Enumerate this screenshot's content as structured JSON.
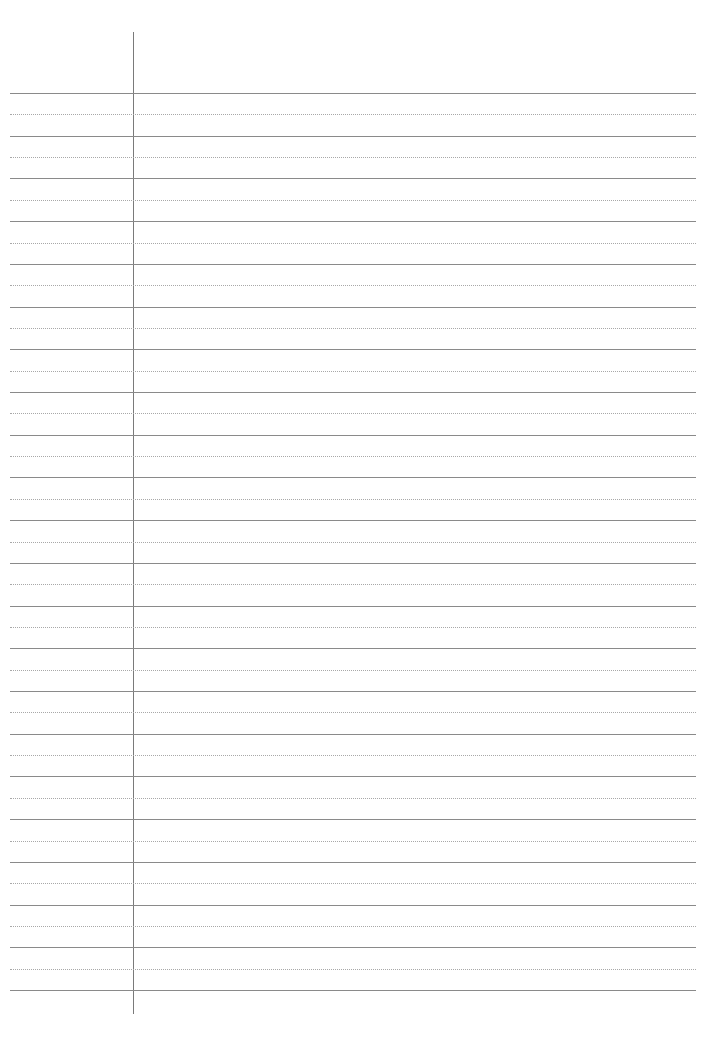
{
  "page": {
    "type": "lined-paper",
    "solid_line_count": 22,
    "dotted_line_count": 21,
    "colors": {
      "background": "#ffffff",
      "solid_line": "#8a8a8a",
      "dotted_line": "#a8a8a8",
      "margin_line": "#7a7a7a"
    }
  }
}
